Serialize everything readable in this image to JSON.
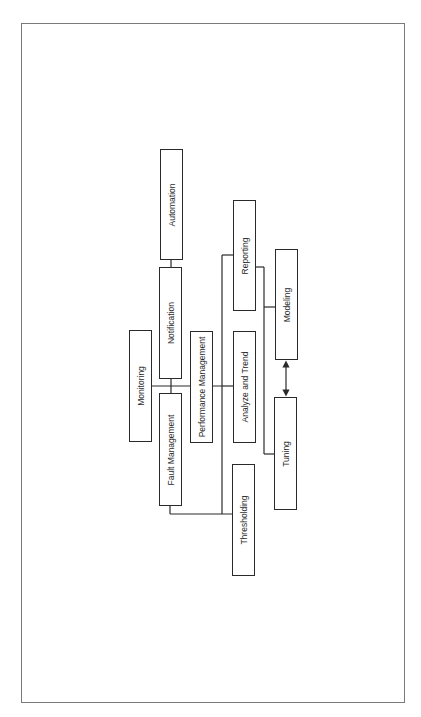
{
  "diagram": {
    "orientation": "rotated-90-ccw",
    "nodes": [
      {
        "id": "automation",
        "label": "Automation"
      },
      {
        "id": "notification",
        "label": "Notification"
      },
      {
        "id": "monitoring",
        "label": "Monitoring"
      },
      {
        "id": "fault_management",
        "label": "Fault Management"
      },
      {
        "id": "performance_management",
        "label": "Performance Management"
      },
      {
        "id": "reporting",
        "label": "Reporting"
      },
      {
        "id": "analyze_and_trend",
        "label": "Analyze and Trend"
      },
      {
        "id": "thresholding",
        "label": "Thresholding"
      },
      {
        "id": "modeling",
        "label": "Modeling"
      },
      {
        "id": "tuning",
        "label": "Tuning"
      }
    ],
    "edges": [
      {
        "from": "notification",
        "to": "automation"
      },
      {
        "from": "monitoring",
        "to": "notification"
      },
      {
        "from": "monitoring",
        "to": "fault_management"
      },
      {
        "from": "monitoring",
        "to": "performance_management"
      },
      {
        "from": "performance_management",
        "to": "reporting"
      },
      {
        "from": "performance_management",
        "to": "analyze_and_trend"
      },
      {
        "from": "performance_management",
        "to": "thresholding"
      },
      {
        "from": "fault_management",
        "to": "thresholding"
      },
      {
        "from": "reporting",
        "to": "modeling"
      },
      {
        "from": "reporting",
        "to": "tuning"
      },
      {
        "from": "modeling",
        "to": "tuning",
        "type": "bidirectional-arrow"
      }
    ]
  }
}
